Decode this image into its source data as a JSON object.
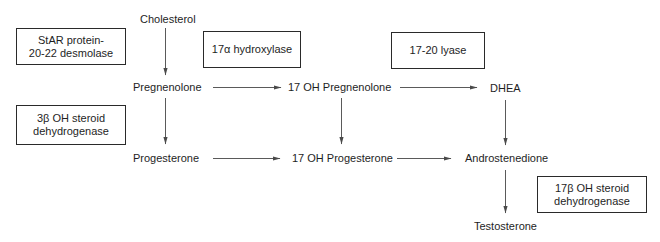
{
  "diagram": {
    "type": "steroidogenesis-pathway",
    "compounds": {
      "cholesterol": "Cholesterol",
      "pregnenolone": "Pregnenolone",
      "oh17_pregnenolone": "17 OH Pregnenolone",
      "dhea": "DHEA",
      "progesterone": "Progesterone",
      "oh17_progesterone": "17 OH Progesterone",
      "androstenedione": "Androstenedione",
      "testosterone": "Testosterone"
    },
    "enzymes": {
      "star": {
        "line1": "StAR protein-",
        "line2": "20-22 desmolase"
      },
      "hydroxylase17a": {
        "line1": "17α hydroxylase"
      },
      "lyase1720": {
        "line1": "17-20 lyase"
      },
      "hsd3b": {
        "line1": "3β OH steroid",
        "line2": "dehydrogenase"
      },
      "hsd17b": {
        "line1": "17β OH steroid",
        "line2": "dehydrogenase"
      }
    },
    "edges": [
      {
        "from": "Cholesterol",
        "to": "Pregnenolone"
      },
      {
        "from": "Pregnenolone",
        "to": "17 OH Pregnenolone"
      },
      {
        "from": "17 OH Pregnenolone",
        "to": "DHEA"
      },
      {
        "from": "Pregnenolone",
        "to": "Progesterone"
      },
      {
        "from": "17 OH Pregnenolone",
        "to": "17 OH Progesterone"
      },
      {
        "from": "DHEA",
        "to": "Androstenedione"
      },
      {
        "from": "Progesterone",
        "to": "17 OH Progesterone"
      },
      {
        "from": "17 OH Progesterone",
        "to": "Androstenedione"
      },
      {
        "from": "Androstenedione",
        "to": "Testosterone"
      }
    ],
    "colors": {
      "arrow": "#5a5a5a",
      "box_border": "#2a2a2a",
      "text": "#1e1e1e"
    }
  }
}
